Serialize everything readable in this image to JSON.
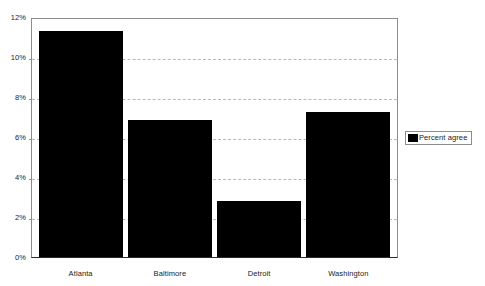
{
  "chart_data": {
    "type": "bar",
    "title": "",
    "subtitle": "",
    "xlabel": "",
    "ylabel": "",
    "categories": [
      "Atlanta",
      "Baltimore",
      "Detroit",
      "Washington"
    ],
    "series": [
      {
        "name": "Percent agree",
        "values": [
          11.35,
          6.9,
          2.8,
          7.3
        ],
        "color": "#000000"
      }
    ],
    "ylim": [
      0,
      12
    ],
    "ytick_values": [
      0,
      2,
      4,
      6,
      8,
      10,
      12
    ],
    "ytick_labels": [
      "0%",
      "2%",
      "4%",
      "6%",
      "8%",
      "10%",
      "12%"
    ],
    "grid": "horizontal-dashed",
    "legend": {
      "position": "right-middle",
      "entries": [
        {
          "label": "Percent agree",
          "swatch": "legend-swatch-black"
        }
      ]
    },
    "axis_color": "#8c8c8c",
    "gridline_color": "#b9b9b9",
    "background": "#ffffff"
  }
}
